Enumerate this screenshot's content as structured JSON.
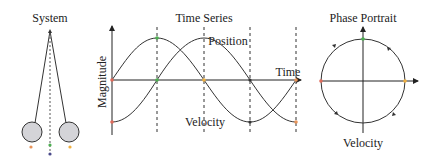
{
  "panels": {
    "system": {
      "title": "System"
    },
    "time_series": {
      "title": "Time Series",
      "ylabel": "Magnitude",
      "xlabel": "Time",
      "series_labels": {
        "position": "Position",
        "velocity": "Velocity"
      }
    },
    "phase_portrait": {
      "title": "Phase Portrait",
      "ylabel": "Velocity"
    }
  },
  "colors": {
    "line": "#333333",
    "bob_fill": "#d4d4d8",
    "marker_orange": "#e8945a",
    "marker_red": "#e06a5a",
    "marker_green": "#4caf50",
    "marker_blue": "#4a4a8a",
    "marker_yellow": "#f0b040"
  }
}
